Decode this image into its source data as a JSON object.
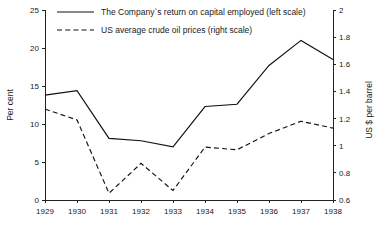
{
  "chart_data": {
    "type": "line",
    "title": "",
    "subtitle": "",
    "xlabel": "",
    "ylabel": "Per cent",
    "y2label": "US $ per barrel",
    "categories": [
      "1929",
      "1930",
      "1931",
      "1932",
      "1933",
      "1934",
      "1935",
      "1936",
      "1937",
      "1938"
    ],
    "x": [
      1929,
      1930,
      1931,
      1932,
      1933,
      1934,
      1935,
      1936,
      1937,
      1938
    ],
    "ylim": [
      0,
      25
    ],
    "y2lim": [
      0.6,
      2.0
    ],
    "yticks": [
      0,
      5,
      10,
      15,
      20,
      25
    ],
    "y2ticks": [
      0.6,
      0.8,
      1,
      1.2,
      1.4,
      1.6,
      1.8,
      2
    ],
    "ytick_labels": [
      "0",
      "5",
      "10",
      "15",
      "20",
      "25"
    ],
    "y2tick_labels": [
      "0.6",
      "0.8",
      "1",
      "1.2",
      "1.4",
      "1.6",
      "1.8",
      "2"
    ],
    "grid": false,
    "legend_position": "top-left",
    "series": [
      {
        "name": "The Company`s return on capital employed (left scale)",
        "axis": "left",
        "style": "solid",
        "color": "#111111",
        "values": [
          13.8,
          14.4,
          8.1,
          7.8,
          7.0,
          12.3,
          12.6,
          17.7,
          21.0,
          18.5
        ]
      },
      {
        "name": "US average crude oil prices (right scale)",
        "axis": "right",
        "style": "dashed",
        "color": "#111111",
        "values": [
          1.27,
          1.19,
          0.65,
          0.87,
          0.67,
          0.99,
          0.97,
          1.09,
          1.18,
          1.13
        ]
      }
    ]
  },
  "legend": {
    "items": [
      {
        "label": "The Company`s return on capital employed (left scale)",
        "style": "solid"
      },
      {
        "label": "US average crude oil prices (right scale)",
        "style": "dashed"
      }
    ]
  },
  "axes": {
    "left_title": "Per cent",
    "right_title": "US $ per barrel"
  }
}
